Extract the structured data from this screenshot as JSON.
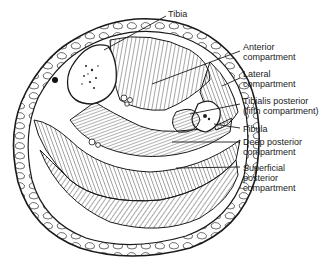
{
  "figure": {
    "labels": {
      "tibia": "Tibia",
      "anterior": "Anterior\ncompartment",
      "lateral": "Lateral\ncompartment",
      "tibialis_posterior": "Tibialis posterior\n(fifth compartment)",
      "fibula": "Fibula",
      "deep_posterior": "Deep posterior\ncompartment",
      "superficial_posterior": "Superficial\nposterior\ncompartment"
    },
    "colors": {
      "ink": "#1a1a1a",
      "background": "#ffffff"
    }
  }
}
